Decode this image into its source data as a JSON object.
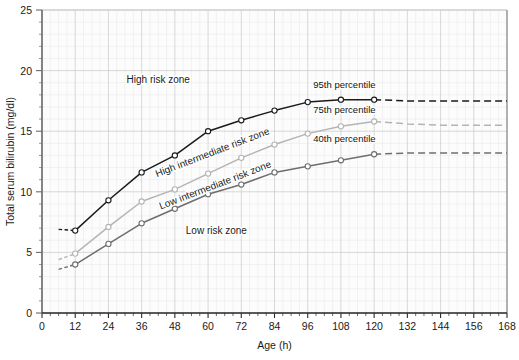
{
  "figure": {
    "caption_partial": ""
  },
  "axes": {
    "x": {
      "title": "Age (h)",
      "min": 0,
      "max": 168,
      "major_step": 12,
      "minor_step": 3,
      "ticks": [
        "0",
        "12",
        "24",
        "36",
        "48",
        "60",
        "72",
        "84",
        "96",
        "108",
        "120",
        "132",
        "144",
        "156",
        "168"
      ]
    },
    "y": {
      "title": "Total serum bilirubin (mg/dl)",
      "min": 0,
      "max": 25,
      "major_step": 5,
      "minor_step": 1,
      "ticks": [
        "0",
        "5",
        "10",
        "15",
        "20",
        "25"
      ]
    }
  },
  "zone_labels": {
    "high_risk": "High risk zone",
    "high_intermediate": "High intermediate risk zone",
    "low_intermediate": "Low intermediate risk zone",
    "low_risk": "Low risk zone"
  },
  "curve_labels": {
    "p95": "95th percentile",
    "p75": "75th percentile",
    "p40": "40th percentile"
  },
  "colors": {
    "p95": "#1a1a1a",
    "p75": "#b4b4b4",
    "p40": "#6e6e6e",
    "grid_major": "#c9c9c9",
    "grid_minor": "#e6e6e6",
    "axis": "#6b6b6b",
    "plot_bg": "#fcfcfc"
  },
  "chart_data": {
    "type": "line",
    "title": "",
    "xlabel": "Age (h)",
    "ylabel": "Total serum bilirubin (mg/dl)",
    "xlim": [
      0,
      168
    ],
    "ylim": [
      0,
      25
    ],
    "grid": true,
    "legend": "inline-end-labels",
    "x": [
      12,
      24,
      36,
      48,
      60,
      72,
      84,
      96,
      108,
      120,
      132,
      144,
      156,
      168
    ],
    "series": [
      {
        "name": "95th percentile",
        "color": "#1a1a1a",
        "values": [
          6.8,
          9.3,
          11.6,
          13.0,
          15.0,
          15.9,
          16.7,
          17.4,
          17.6,
          17.6,
          17.5,
          17.5,
          17.5,
          17.5
        ],
        "dashed_from": 120,
        "dashed_lead_in": {
          "x": [
            6,
            12
          ],
          "values": [
            6.9,
            6.8
          ]
        },
        "marker": "open-circle"
      },
      {
        "name": "75th percentile",
        "color": "#b4b4b4",
        "values": [
          4.9,
          7.1,
          9.2,
          10.2,
          11.5,
          12.8,
          13.9,
          14.8,
          15.4,
          15.8,
          15.6,
          15.5,
          15.5,
          15.5
        ],
        "dashed_from": 120,
        "dashed_lead_in": {
          "x": [
            6,
            12
          ],
          "values": [
            4.4,
            4.9
          ]
        },
        "marker": "open-circle"
      },
      {
        "name": "40th percentile",
        "color": "#6e6e6e",
        "values": [
          4.0,
          5.7,
          7.4,
          8.6,
          9.8,
          10.6,
          11.6,
          12.1,
          12.6,
          13.1,
          13.2,
          13.2,
          13.2,
          13.2
        ],
        "dashed_from": 120,
        "dashed_lead_in": {
          "x": [
            6,
            12
          ],
          "values": [
            3.6,
            4.0
          ]
        },
        "marker": "open-circle"
      }
    ],
    "annotations": [
      {
        "text": "High risk zone",
        "x": 42,
        "y": 19.0
      },
      {
        "text": "High intermediate risk zone",
        "x": 62,
        "y": 13.0,
        "rotation": -21
      },
      {
        "text": "Low intermediate risk zone",
        "x": 63,
        "y": 10.3,
        "rotation": -21
      },
      {
        "text": "Low risk zone",
        "x": 63,
        "y": 6.5
      },
      {
        "text": "95th percentile",
        "x": 98,
        "y": 18.6
      },
      {
        "text": "75th percentile",
        "x": 98,
        "y": 16.5
      },
      {
        "text": "40th percentile",
        "x": 98,
        "y": 14.1
      }
    ]
  }
}
